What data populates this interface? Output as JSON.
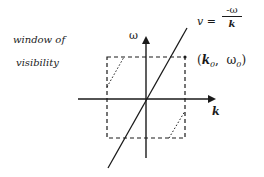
{
  "diagram": {
    "side_label": {
      "line1": "window of",
      "line2": "visibility"
    },
    "axes": {
      "vertical_label": "ω",
      "horizontal_label": "k"
    },
    "equation": {
      "lhs": "v =",
      "numerator": "-ω",
      "denominator": "k"
    },
    "point_label": {
      "open": "(",
      "k": "k",
      "k_sub": "0",
      "sep": ",  ",
      "w": "ω",
      "w_sub": "0",
      "close": ")"
    },
    "colors": {
      "ink": "#1a1a1a",
      "background": "#ffffff"
    }
  }
}
